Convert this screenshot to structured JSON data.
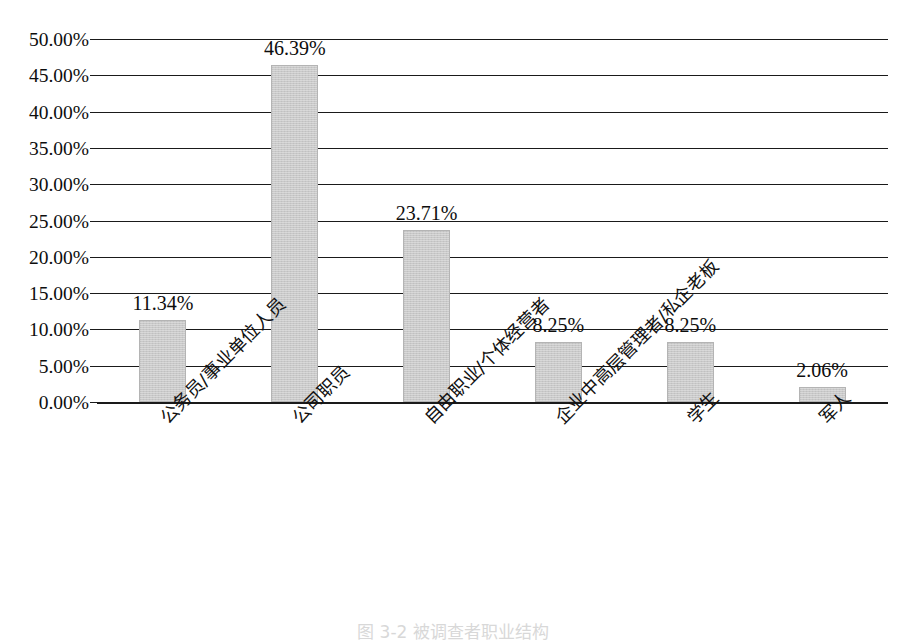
{
  "chart_data": {
    "type": "bar",
    "title": "",
    "subtitle": "",
    "xlabel": "",
    "ylabel": "",
    "categories": [
      "公务员/事业单位人员",
      "公司职员",
      "自由职业/个体经营者",
      "企业中高层管理者/私企老板",
      "学生",
      "军人"
    ],
    "values": [
      11.34,
      46.39,
      23.71,
      8.25,
      8.25,
      2.06
    ],
    "value_labels": [
      "11.34%",
      "46.39%",
      "23.71%",
      "8.25%",
      "8.25%",
      "2.06%"
    ],
    "ylim": [
      0,
      50
    ],
    "ytick_values": [
      50,
      45,
      40,
      35,
      30,
      25,
      20,
      15,
      10,
      5,
      0
    ],
    "ytick_labels": [
      "50.00%",
      "45.00%",
      "40.00%",
      "35.00%",
      "30.00%",
      "25.00%",
      "20.00%",
      "15.00%",
      "10.00%",
      "5.00%",
      "0.00%"
    ],
    "grid": true,
    "grid_axis": "y",
    "legend": false,
    "legend_position": "none",
    "bar_color": "#c9c9c9",
    "bar_edge_color": "#b4b4b4",
    "gridline_color": "#1a1a1a",
    "background_color": "#ffffff",
    "text_color": "#0d0d0d",
    "category_label_rotation": -45
  },
  "caption": {
    "text": "图 3-2  被调查者职业结构"
  }
}
